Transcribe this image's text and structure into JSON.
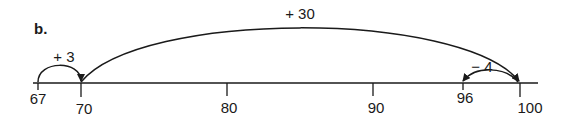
{
  "part_label": "b.",
  "number_line": {
    "ticks": [
      {
        "value": "67",
        "x": 38,
        "label_y": 103
      },
      {
        "value": "70",
        "x": 81,
        "label_y": 112
      },
      {
        "value": "80",
        "x": 227,
        "label_y": 112
      },
      {
        "value": "90",
        "x": 373,
        "label_y": 112
      },
      {
        "value": "96",
        "x": 463,
        "label_y": 103
      },
      {
        "value": "100",
        "x": 520,
        "label_y": 112
      }
    ]
  },
  "jumps": [
    {
      "label": "+ 3",
      "from": "67",
      "to": "70"
    },
    {
      "label": "+ 30",
      "from": "70",
      "to": "100"
    },
    {
      "label": "− 4",
      "from": "100",
      "to": "96"
    }
  ],
  "colors": {
    "ink": "#1a1a1a",
    "background": "#ffffff"
  }
}
